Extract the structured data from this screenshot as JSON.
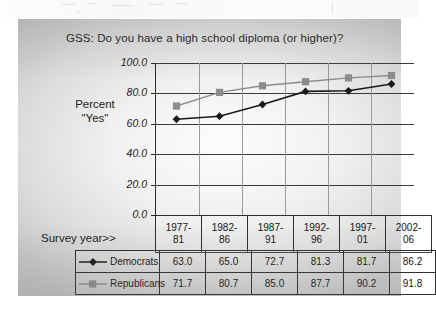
{
  "chart_data": {
    "type": "line",
    "title": "GSS:  Do you have a high school diploma (or higher)?",
    "xlabel": "Survey year>>",
    "ylabel_line1": "Percent",
    "ylabel_line2": "\"Yes\"",
    "categories": [
      "1977-81",
      "1982-86",
      "1987-91",
      "1992-96",
      "1997-01",
      "2002-06"
    ],
    "category_lines": [
      [
        "1977-",
        "81"
      ],
      [
        "1982-",
        "86"
      ],
      [
        "1987-",
        "91"
      ],
      [
        "1992-",
        "96"
      ],
      [
        "1997-",
        "01"
      ],
      [
        "2002-",
        "06"
      ]
    ],
    "series": [
      {
        "name": "Democrats",
        "marker": "diamond",
        "color": "#1a1a1a",
        "values": [
          63.0,
          65.0,
          72.7,
          81.3,
          81.7,
          86.2
        ],
        "value_labels": [
          "63.0",
          "65.0",
          "72.7",
          "81.3",
          "81.7",
          "86.2"
        ]
      },
      {
        "name": "Republicans",
        "marker": "square",
        "color": "#8c8c8c",
        "values": [
          71.7,
          80.7,
          85.0,
          87.7,
          90.2,
          91.8
        ],
        "value_labels": [
          "71.7",
          "80.7",
          "85.0",
          "87.7",
          "90.2",
          "91.8"
        ]
      }
    ],
    "ylim": [
      0,
      100
    ],
    "yticks": [
      100.0,
      80.0,
      60.0,
      40.0,
      20.0,
      0.0
    ],
    "ytick_labels": [
      "100.0",
      "80.0",
      "60.0",
      "40.0",
      "20.0",
      "0.0"
    ],
    "grid": true,
    "legend_position": "data-table-left-column"
  }
}
